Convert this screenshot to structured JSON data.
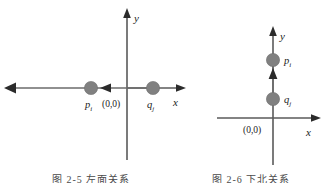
{
  "figure": {
    "colors": {
      "axis": "#5a5a5a",
      "vector": "#6b6b6b",
      "arrow": "#2b2b2b",
      "dot": "#808080",
      "text": "#1a1a1a",
      "background": "#ffffff"
    }
  },
  "left_diagram": {
    "name": "horizontal-relation",
    "axis_x_label": "x",
    "axis_y_label": "y",
    "origin_label": "(0,0)",
    "points": [
      {
        "id": "p",
        "label_base": "p",
        "label_sub": "i",
        "x": 91,
        "y": 88
      },
      {
        "id": "q",
        "label_base": "q",
        "label_sub": "j",
        "x": 153,
        "y": 88
      }
    ],
    "direction": "left"
  },
  "right_diagram": {
    "name": "vertical-relation",
    "axis_x_label": "x",
    "axis_y_label": "y",
    "origin_label": "(0,0)",
    "points": [
      {
        "id": "p",
        "label_base": "p",
        "label_sub": "i",
        "x": 273,
        "y": 60
      },
      {
        "id": "q",
        "label_base": "q",
        "label_sub": "j",
        "x": 273,
        "y": 99
      }
    ],
    "direction": "up"
  },
  "captions": {
    "left": "图 2-5   左面关系",
    "right": "图 2-6   下北关系"
  }
}
